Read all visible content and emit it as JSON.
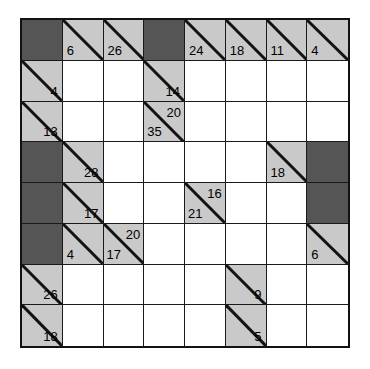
{
  "puzzle": {
    "type": "kakuro",
    "rows": 8,
    "cols": 8,
    "colors": {
      "block": "#555555",
      "clue": "#c9c9c9",
      "empty": "#ffffff",
      "line": "#121212",
      "text": "#000000"
    },
    "grid": [
      [
        {
          "kind": "block"
        },
        {
          "kind": "clue",
          "down": "6"
        },
        {
          "kind": "clue",
          "down": "26"
        },
        {
          "kind": "block"
        },
        {
          "kind": "clue",
          "down": "24"
        },
        {
          "kind": "clue",
          "down": "18"
        },
        {
          "kind": "clue",
          "down": "11"
        },
        {
          "kind": "clue",
          "down": "4"
        }
      ],
      [
        {
          "kind": "clue",
          "across": "4"
        },
        {
          "kind": "empty"
        },
        {
          "kind": "empty"
        },
        {
          "kind": "clue",
          "across": "14"
        },
        {
          "kind": "empty"
        },
        {
          "kind": "empty"
        },
        {
          "kind": "empty"
        },
        {
          "kind": "empty"
        }
      ],
      [
        {
          "kind": "clue",
          "across": "13"
        },
        {
          "kind": "empty"
        },
        {
          "kind": "empty"
        },
        {
          "kind": "clue",
          "across": "20",
          "down": "35"
        },
        {
          "kind": "empty"
        },
        {
          "kind": "empty"
        },
        {
          "kind": "empty"
        },
        {
          "kind": "empty"
        }
      ],
      [
        {
          "kind": "block"
        },
        {
          "kind": "clue",
          "across": "28"
        },
        {
          "kind": "empty"
        },
        {
          "kind": "empty"
        },
        {
          "kind": "empty"
        },
        {
          "kind": "empty"
        },
        {
          "kind": "clue",
          "down": "18"
        },
        {
          "kind": "block"
        }
      ],
      [
        {
          "kind": "block"
        },
        {
          "kind": "clue",
          "across": "17"
        },
        {
          "kind": "empty"
        },
        {
          "kind": "empty"
        },
        {
          "kind": "clue",
          "across": "16",
          "down": "21"
        },
        {
          "kind": "empty"
        },
        {
          "kind": "empty"
        },
        {
          "kind": "block"
        }
      ],
      [
        {
          "kind": "block"
        },
        {
          "kind": "clue",
          "down": "4"
        },
        {
          "kind": "clue",
          "across": "20",
          "down": "17"
        },
        {
          "kind": "empty"
        },
        {
          "kind": "empty"
        },
        {
          "kind": "empty"
        },
        {
          "kind": "empty"
        },
        {
          "kind": "clue",
          "down": "6"
        }
      ],
      [
        {
          "kind": "clue",
          "across": "26"
        },
        {
          "kind": "empty"
        },
        {
          "kind": "empty"
        },
        {
          "kind": "empty"
        },
        {
          "kind": "empty"
        },
        {
          "kind": "clue",
          "across": "9"
        },
        {
          "kind": "empty"
        },
        {
          "kind": "empty"
        }
      ],
      [
        {
          "kind": "clue",
          "across": "18"
        },
        {
          "kind": "empty"
        },
        {
          "kind": "empty"
        },
        {
          "kind": "empty"
        },
        {
          "kind": "empty"
        },
        {
          "kind": "clue",
          "across": "5"
        },
        {
          "kind": "empty"
        },
        {
          "kind": "empty"
        }
      ]
    ]
  }
}
